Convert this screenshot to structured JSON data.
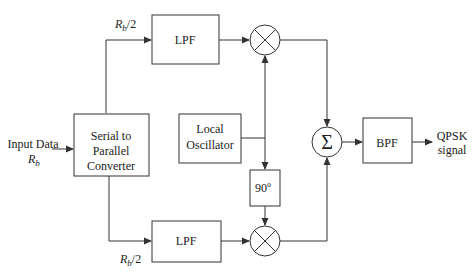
{
  "diagram": {
    "input": {
      "label_line1": "Input Data",
      "label_line2_main": "R",
      "label_line2_sub": "b"
    },
    "converter": {
      "line1": "Serial to",
      "line2": "Parallel",
      "line3": "Converter"
    },
    "top_branch": {
      "rate_main": "R",
      "rate_sub": "b",
      "rate_suffix": "/2",
      "filter": "LPF"
    },
    "bottom_branch": {
      "rate_main": "R",
      "rate_sub": "b",
      "rate_suffix": "/2",
      "filter": "LPF"
    },
    "oscillator": {
      "line1": "Local",
      "line2": "Oscillator"
    },
    "phase_shift": {
      "value": "90",
      "unit": "o"
    },
    "summer": {
      "symbol": "Σ"
    },
    "bandpass": {
      "label": "BPF"
    },
    "output": {
      "line1": "QPSK",
      "line2": "signal"
    }
  },
  "colors": {
    "stroke": "#333333",
    "text": "#222222",
    "background": "#ffffff"
  }
}
